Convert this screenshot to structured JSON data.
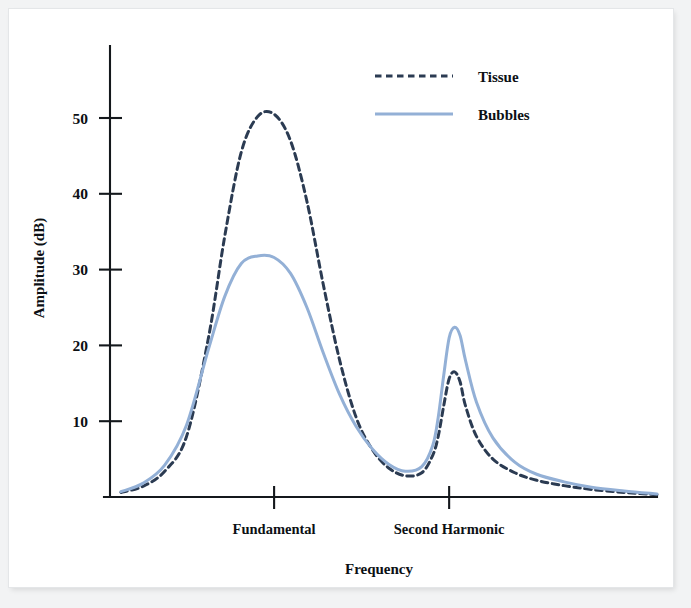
{
  "figure": {
    "background_color": "#ffffff",
    "frame_color": "#f2f3f4"
  },
  "chart_data": {
    "type": "line",
    "title": "",
    "subtitle": "",
    "xlabel": "Frequency",
    "ylabel": "Amplitude (dB)",
    "grid": false,
    "legend_position": "top-right",
    "xlim": [
      0,
      100
    ],
    "ylim": [
      0,
      57
    ],
    "y_ticks": [
      10,
      20,
      30,
      40,
      50
    ],
    "y_tick_labels": [
      "10",
      "20",
      "30",
      "40",
      "50"
    ],
    "x_ticks": [
      30,
      62
    ],
    "x_tick_labels": [
      "Fundamental",
      "Second Harmonic"
    ],
    "annotations": [],
    "series": [
      {
        "name": "Tissue",
        "color": "#2b3b52",
        "style": "dashed",
        "linewidth": 3.0,
        "peaks": [
          {
            "at": "Fundamental",
            "value": 50.5
          },
          {
            "at": "Second Harmonic",
            "value": 16.5
          }
        ],
        "valley_value": 2.6,
        "x": [
          2,
          6,
          10,
          14,
          18,
          21,
          24,
          27,
          30,
          33,
          36,
          39,
          42,
          45,
          48,
          51,
          54,
          57,
          59,
          60,
          61,
          62,
          63,
          64,
          65,
          67,
          70,
          74,
          78,
          83,
          88,
          94,
          100
        ],
        "y": [
          0.6,
          1.4,
          3.4,
          8.0,
          21.0,
          34.5,
          45.5,
          50.2,
          50.5,
          47.0,
          39.0,
          28.0,
          18.0,
          10.5,
          6.2,
          3.8,
          2.8,
          3.2,
          5.5,
          8.0,
          12.0,
          15.6,
          16.5,
          15.2,
          12.0,
          8.0,
          5.0,
          3.2,
          2.2,
          1.5,
          1.0,
          0.6,
          0.3
        ]
      },
      {
        "name": "Bubbles",
        "color": "#93b0d6",
        "style": "solid",
        "linewidth": 3.0,
        "peaks": [
          {
            "at": "Fundamental",
            "value": 31.8
          },
          {
            "at": "Second Harmonic",
            "value": 22.4
          }
        ],
        "valley_value": 3.1,
        "x": [
          2,
          6,
          10,
          14,
          18,
          21,
          24,
          27,
          30,
          33,
          36,
          39,
          42,
          45,
          48,
          51,
          54,
          57,
          59,
          60,
          61,
          62,
          63,
          64,
          65,
          67,
          70,
          74,
          78,
          83,
          88,
          94,
          100
        ],
        "y": [
          0.7,
          1.8,
          4.2,
          9.5,
          19.5,
          26.5,
          30.8,
          31.8,
          31.6,
          29.5,
          25.0,
          19.0,
          13.5,
          9.3,
          6.3,
          4.3,
          3.4,
          4.0,
          6.8,
          10.5,
          16.0,
          21.0,
          22.4,
          21.3,
          18.0,
          12.5,
          7.8,
          4.6,
          3.0,
          2.0,
          1.3,
          0.8,
          0.4
        ]
      }
    ]
  },
  "legend": {
    "entries": [
      {
        "label": "Tissue",
        "swatch": "dashed-line-swatch"
      },
      {
        "label": "Bubbles",
        "swatch": "solid-line-swatch"
      }
    ]
  },
  "axes": {
    "y_axis_title": "Amplitude (dB)",
    "x_axis_title": "Frequency",
    "y_tick_labels": [
      "50",
      "40",
      "30",
      "20",
      "10"
    ],
    "x_tick_labels": [
      "Fundamental",
      "Second Harmonic"
    ]
  }
}
